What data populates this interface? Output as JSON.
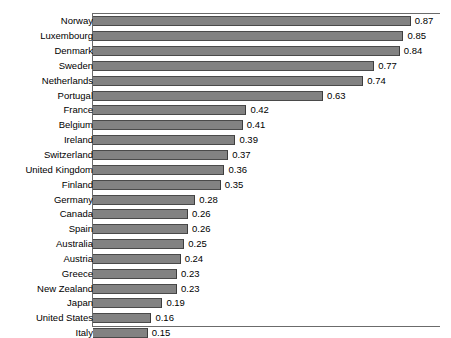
{
  "chart_data": {
    "type": "bar",
    "orientation": "horizontal",
    "title": "",
    "subtitle": "",
    "xlabel": "",
    "ylabel": "",
    "xlim": [
      0,
      0.95
    ],
    "ylim": null,
    "grid": false,
    "legend": null,
    "legend_position": "none",
    "bar_color": "#828282",
    "bar_border_color": "#4a4a4a",
    "axis_color": "#6b6b6b",
    "value_label_format": "0.00",
    "categories": [
      "Norway",
      "Luxembourg",
      "Denmark",
      "Sweden",
      "Netherlands",
      "Portugal",
      "France",
      "Belgium",
      "Ireland",
      "Switzerland",
      "United Kingdom",
      "Finland",
      "Germany",
      "Canada",
      "Spain",
      "Australia",
      "Austria",
      "Greece",
      "New Zealand",
      "Japan",
      "United States",
      "Italy"
    ],
    "values": [
      0.87,
      0.85,
      0.84,
      0.77,
      0.74,
      0.63,
      0.42,
      0.41,
      0.39,
      0.37,
      0.36,
      0.35,
      0.28,
      0.26,
      0.26,
      0.25,
      0.24,
      0.23,
      0.23,
      0.19,
      0.16,
      0.15
    ],
    "value_labels": [
      "0.87",
      "0.85",
      "0.84",
      "0.77",
      "0.74",
      "0.63",
      "0.42",
      "0.41",
      "0.39",
      "0.37",
      "0.36",
      "0.35",
      "0.28",
      "0.26",
      "0.26",
      "0.25",
      "0.24",
      "0.23",
      "0.23",
      "0.19",
      "0.16",
      "0.15"
    ]
  }
}
